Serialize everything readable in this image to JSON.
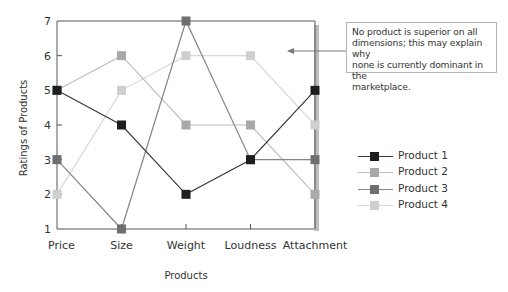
{
  "chart_data": {
    "type": "line",
    "title": "",
    "xlabel": "Products",
    "ylabel": "Ratings of Products",
    "categories": [
      "Price",
      "Size",
      "Weight",
      "Loudness",
      "Attachment"
    ],
    "ylim": [
      1,
      7
    ],
    "yticks": [
      1,
      2,
      3,
      4,
      5,
      6,
      7
    ],
    "grid": false,
    "legend_position": "right",
    "series": [
      {
        "name": "Product 1",
        "values": [
          5,
          4,
          2,
          3,
          5
        ],
        "color": "#1e1e1e",
        "line_color": "#3a3a3a"
      },
      {
        "name": "Product 2",
        "values": [
          5,
          6,
          4,
          4,
          2
        ],
        "color": "#a9a9a9",
        "line_color": "#bdbdbd"
      },
      {
        "name": "Product 3",
        "values": [
          3,
          1,
          7,
          3,
          3
        ],
        "color": "#6e6e6e",
        "line_color": "#858585"
      },
      {
        "name": "Product 4",
        "values": [
          2,
          5,
          6,
          6,
          4
        ],
        "color": "#cfcfcf",
        "line_color": "#d8d8d8"
      }
    ],
    "annotation": {
      "text": "No product is superior on all dimensions; this may explain why none is currently dominant in the marketplace."
    }
  },
  "annotation_lines": [
    "No product is superior on all",
    "dimensions; this may explain why",
    "none is currently dominant in the",
    "marketplace."
  ]
}
